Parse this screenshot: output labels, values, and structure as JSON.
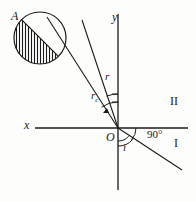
{
  "figure": {
    "type": "optics-refraction-diagram",
    "background_color": "#fdfdfc",
    "stroke_color": "#1a1a1a"
  },
  "labels": {
    "source_point": "A",
    "y_axis": "y",
    "x_axis": "x",
    "origin": "O",
    "refracted_ray": "r",
    "critical_ray_base": "r",
    "critical_ray_sub": "c",
    "incident_angle": "i",
    "right_angle": "90°",
    "region_two": "II",
    "region_one": "I"
  },
  "geometry": {
    "origin": {
      "x": 118,
      "y": 128
    },
    "x_axis": {
      "x1": 35,
      "y1": 128,
      "x2": 188,
      "y2": 128
    },
    "y_axis": {
      "x1": 118,
      "y1": 14,
      "x2": 118,
      "y2": 190
    },
    "circle": {
      "cx": 40,
      "cy": 38,
      "r": 26
    },
    "hatch_angle_deg": 90,
    "rays": [
      {
        "name": "ray-to-source-A",
        "x1": 118,
        "y1": 128,
        "x2": 46,
        "y2": 16
      },
      {
        "name": "ray-r",
        "x1": 118,
        "y1": 128,
        "x2": 82,
        "y2": 20
      },
      {
        "name": "ray-incident-i",
        "x1": 118,
        "y1": 128,
        "x2": 182,
        "y2": 170
      }
    ],
    "arcs": [
      {
        "name": "arc-r",
        "radius": 34
      },
      {
        "name": "arc-rc",
        "radius": 26
      },
      {
        "name": "arc-i-outer",
        "radius": 18
      },
      {
        "name": "arc-i-inner",
        "radius": 13
      }
    ]
  }
}
